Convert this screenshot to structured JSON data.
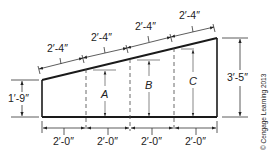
{
  "figure": {
    "shape": "trapezoidal wall section with sloped top",
    "top_dimensions": [
      "2′-4″",
      "2′-4″",
      "2′-4″",
      "2′-4″"
    ],
    "bottom_dimensions": [
      "2′-0″",
      "2′-0″",
      "2′-0″",
      "2′-0″"
    ],
    "left_height": "1′-9″",
    "right_height": "3′-5″",
    "unknown_heights": [
      "A",
      "B",
      "C"
    ],
    "copyright": "© Cengage Learning 2013"
  },
  "colors": {
    "stroke": "#1a1a1a",
    "dimension": "#333333",
    "text": "#222222"
  }
}
